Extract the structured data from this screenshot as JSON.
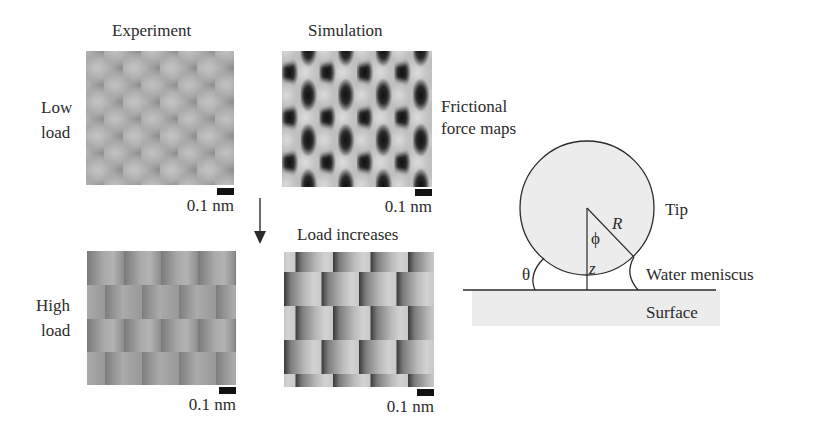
{
  "columns": {
    "experiment": "Experiment",
    "simulation": "Simulation"
  },
  "rows": {
    "low_load": [
      "Low",
      "load"
    ],
    "high_load": [
      "High",
      "load"
    ]
  },
  "side_labels": {
    "frictional_force_maps": [
      "Frictional",
      "force maps"
    ],
    "load_increases": "Load increases"
  },
  "scale_bars": {
    "exp_low": "0.1 nm",
    "sim_low": "0.1 nm",
    "exp_high": "0.1 nm",
    "sim_high": "0.1 nm"
  },
  "schematic": {
    "tip_label": "Tip",
    "meniscus_label": "Water meniscus",
    "surface_label": "Surface",
    "radius_symbol": "R",
    "angle_phi": "ϕ",
    "height_z": "z",
    "contact_angle": "θ"
  },
  "colors": {
    "ink": "#2b2b2b",
    "surface_fill": "#ececec",
    "tip_fill": "#e9e9e9",
    "scale_bar": "#111111"
  }
}
